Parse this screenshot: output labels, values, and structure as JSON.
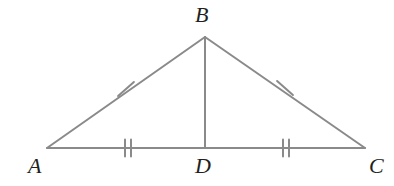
{
  "figure": {
    "kind": "geometry-diagram",
    "shape": "isosceles-triangle-with-median",
    "background_color": "#ffffff",
    "stroke_color": "#8a8a8a",
    "label_color": "#231f20",
    "stroke_width": 2,
    "width": 394,
    "height": 186
  },
  "labels": {
    "a": "A",
    "b": "B",
    "c": "C",
    "d": "D"
  },
  "points": {
    "A": {
      "x": 47,
      "y": 148
    },
    "B": {
      "x": 205,
      "y": 37
    },
    "C": {
      "x": 365,
      "y": 148
    },
    "D": {
      "x": 205,
      "y": 148
    }
  },
  "segments": [
    {
      "name": "AB",
      "from": "A",
      "to": "B",
      "x1": 47,
      "y1": 148,
      "x2": 205,
      "y2": 37,
      "ticks": 1
    },
    {
      "name": "BC",
      "from": "B",
      "to": "C",
      "x1": 205,
      "y1": 37,
      "x2": 365,
      "y2": 148,
      "ticks": 1
    },
    {
      "name": "AC",
      "from": "A",
      "to": "C",
      "x1": 47,
      "y1": 148,
      "x2": 365,
      "y2": 148,
      "ticks": 0
    },
    {
      "name": "BD",
      "from": "B",
      "to": "D",
      "x1": 205,
      "y1": 37,
      "x2": 205,
      "y2": 148,
      "ticks": 0
    }
  ],
  "tick_marks": [
    {
      "name": "tick-ab",
      "on_segment": "AB",
      "count": 1,
      "cx": 126,
      "cy": 89,
      "angle_deg": 125,
      "length": 17
    },
    {
      "name": "tick-bc",
      "on_segment": "BC",
      "count": 1,
      "cx": 285,
      "cy": 88,
      "angle_deg": 55,
      "length": 17
    },
    {
      "name": "tick-ad",
      "on_segment": "AD",
      "count": 2,
      "cx": 128,
      "cy": 148,
      "angle_deg": 90,
      "length": 17,
      "spacing": 6
    },
    {
      "name": "tick-dc",
      "on_segment": "DC",
      "count": 2,
      "cx": 286,
      "cy": 148,
      "angle_deg": 90,
      "length": 17,
      "spacing": 6
    }
  ]
}
